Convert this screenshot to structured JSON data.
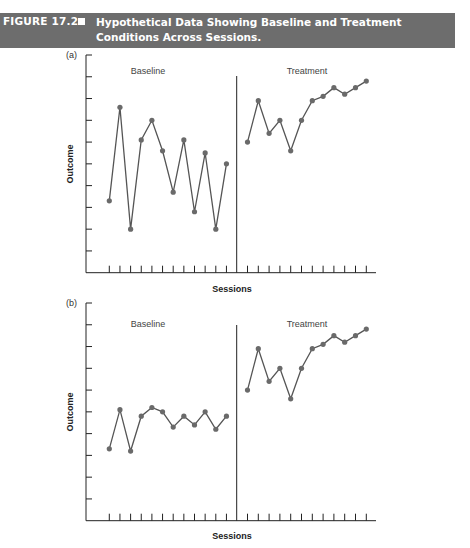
{
  "figure": {
    "number": "FIGURE 17.2",
    "title": "Hypothetical Data Showing Baseline and Treatment Conditions Across Sessions.",
    "banner_color": "#6d6d6d",
    "line_color": "#555555",
    "point_color": "#6a6a6a",
    "axis_color": "#222222"
  },
  "chart_data": [
    {
      "type": "line",
      "panel": "(a)",
      "title": "",
      "xlabel": "Sessions",
      "ylabel": "Outcome",
      "ylim": [
        0,
        10
      ],
      "y_ticks": 10,
      "x_tick_labels": "none",
      "grid": false,
      "phase_divider_after_session": 12,
      "phases": [
        "Baseline",
        "Treatment"
      ],
      "x": [
        1,
        2,
        3,
        4,
        5,
        6,
        7,
        8,
        9,
        10,
        11,
        12,
        13,
        14,
        15,
        16,
        17,
        18,
        19,
        20,
        21,
        22,
        23,
        24
      ],
      "series": [
        {
          "name": "Baseline",
          "x": [
            1,
            2,
            3,
            4,
            5,
            6,
            7,
            8,
            9,
            10,
            11,
            12
          ],
          "values": [
            3.3,
            7.6,
            2.0,
            6.1,
            7.0,
            5.6,
            3.7,
            6.1,
            2.8,
            5.5,
            2.0,
            5.0
          ]
        },
        {
          "name": "Treatment",
          "x": [
            13,
            14,
            15,
            16,
            17,
            18,
            19,
            20,
            21,
            22,
            23,
            24
          ],
          "values": [
            6.0,
            7.9,
            6.4,
            7.0,
            5.6,
            7.0,
            7.9,
            8.1,
            8.5,
            8.2,
            8.5,
            8.8
          ]
        }
      ]
    },
    {
      "type": "line",
      "panel": "(b)",
      "title": "",
      "xlabel": "Sessions",
      "ylabel": "Outcome",
      "ylim": [
        0,
        10
      ],
      "y_ticks": 10,
      "x_tick_labels": "none",
      "grid": false,
      "phase_divider_after_session": 12,
      "phases": [
        "Baseline",
        "Treatment"
      ],
      "x": [
        1,
        2,
        3,
        4,
        5,
        6,
        7,
        8,
        9,
        10,
        11,
        12,
        13,
        14,
        15,
        16,
        17,
        18,
        19,
        20,
        21,
        22,
        23,
        24
      ],
      "series": [
        {
          "name": "Baseline",
          "x": [
            1,
            2,
            3,
            4,
            5,
            6,
            7,
            8,
            9,
            10,
            11,
            12
          ],
          "values": [
            3.3,
            5.1,
            3.2,
            4.8,
            5.2,
            5.0,
            4.3,
            4.8,
            4.4,
            5.0,
            4.2,
            4.8
          ]
        },
        {
          "name": "Treatment",
          "x": [
            13,
            14,
            15,
            16,
            17,
            18,
            19,
            20,
            21,
            22,
            23,
            24
          ],
          "values": [
            6.0,
            7.9,
            6.4,
            7.0,
            5.6,
            7.0,
            7.9,
            8.1,
            8.5,
            8.2,
            8.5,
            8.8
          ]
        }
      ]
    }
  ]
}
